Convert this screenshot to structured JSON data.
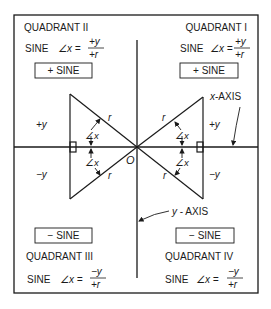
{
  "diagram": {
    "quadrants": {
      "q1": {
        "label": "QUADRANT I",
        "formula_prefix": "SINE",
        "angle": "∠x =",
        "numerator": "+y",
        "denominator": "+r",
        "sign_box": "+ SINE"
      },
      "q2": {
        "label": "QUADRANT II",
        "formula_prefix": "SINE",
        "angle": "∠x =",
        "numerator": "+y",
        "denominator": "+r",
        "sign_box": "+ SINE"
      },
      "q3": {
        "label": "QUADRANT III",
        "formula_prefix": "SINE",
        "angle": "∠x =",
        "numerator": "−y",
        "denominator": "+r",
        "sign_box": "− SINE"
      },
      "q4": {
        "label": "QUADRANT IV",
        "formula_prefix": "SINE",
        "angle": "∠x =",
        "numerator": "−y",
        "denominator": "+r",
        "sign_box": "− SINE"
      }
    },
    "axes": {
      "x_label_italic": "x",
      "x_label_rest": "-AXIS",
      "y_label_italic": "y",
      "y_label_rest": " - AXIS",
      "origin": "O"
    },
    "triangle_labels": {
      "r": "r",
      "angle": "∠x",
      "plus_y": "+y",
      "minus_y": "−y"
    }
  }
}
